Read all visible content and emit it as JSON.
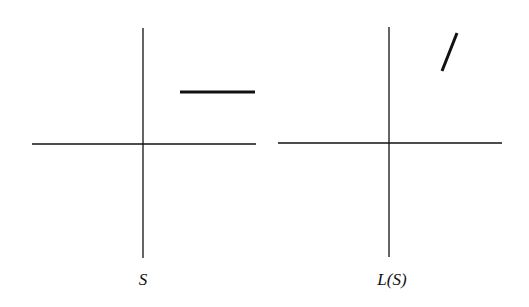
{
  "panels": [
    {
      "label": "S",
      "axes": {
        "cx": 143,
        "cy": 144,
        "x1": 32,
        "x2": 256,
        "y1": 28,
        "y2": 258
      },
      "segment": {
        "x1": 180,
        "y1": 92,
        "x2": 255,
        "y2": 92
      },
      "label_pos": {
        "x": 143,
        "y": 270
      }
    },
    {
      "label": "L(S)",
      "axes": {
        "cx": 389,
        "cy": 143,
        "x1": 278,
        "x2": 502,
        "y1": 27,
        "y2": 257
      },
      "segment": {
        "x1": 442,
        "y1": 71,
        "x2": 457,
        "y2": 33
      },
      "label_pos": {
        "x": 392,
        "y": 270
      }
    }
  ],
  "colors": {
    "line": "#111111",
    "background": "#ffffff"
  }
}
